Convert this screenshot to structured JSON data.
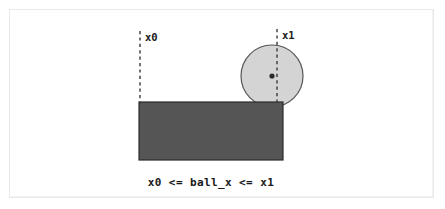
{
  "figure": {
    "title": "",
    "caption": "x0 <= ball_x <= x1",
    "background_color": "#ffffff",
    "frame_color": "#e9e9e9",
    "labels": {
      "x0": "x0",
      "x1": "x1"
    },
    "guides": [
      {
        "name": "x0",
        "label": "x0",
        "x": 140,
        "y_top": 31,
        "y_bottom": 104,
        "style": "dashed",
        "color": "#3a3a3a"
      },
      {
        "name": "x1",
        "label": "x1",
        "x": 277,
        "y_top": 29,
        "y_bottom": 104,
        "style": "dashed",
        "color": "#3a3a3a"
      }
    ],
    "platform": {
      "name": "platform-rectangle",
      "x": 139,
      "y": 102,
      "width": 144,
      "height": 58,
      "fill": "#555555",
      "stroke": "#2b2b2b"
    },
    "ball": {
      "name": "ball-circle",
      "cx": 272,
      "cy": 76,
      "r": 31,
      "fill": "#d4d4d4",
      "stroke": "#555555",
      "center_dot_r": 2.6,
      "center_dot_fill": "#2a2a2a"
    }
  }
}
